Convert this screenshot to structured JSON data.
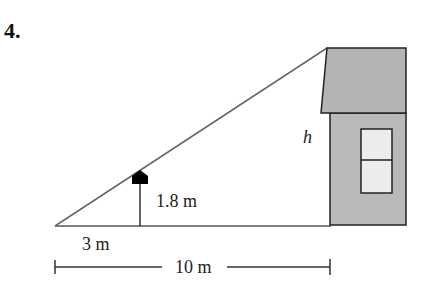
{
  "problem": {
    "number": "4."
  },
  "diagram": {
    "labels": {
      "height_unknown": "h",
      "lamp_height": "1.8 m",
      "lamp_distance": "3 m",
      "total_distance": "10 m"
    },
    "colors": {
      "house_fill": "#b9b9b9",
      "roof_fill": "#b4b4b4",
      "window_fill": "#ececec",
      "line": "#555555",
      "outline": "#222222",
      "lamp": "#000000"
    }
  }
}
